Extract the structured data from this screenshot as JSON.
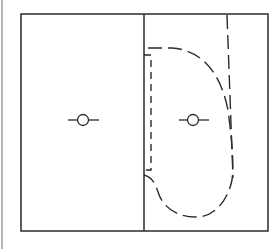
{
  "diagram": {
    "type": "floor-plan-layout",
    "colors": {
      "line": "#2a2a2a",
      "background": "#ffffff",
      "edge": "#b8b8b8"
    },
    "frame": {
      "x": 21,
      "y": 14,
      "width": 247,
      "height": 217
    },
    "divider_x": 144,
    "symbols": [
      {
        "name": "left-fixture-symbol",
        "cx": 83,
        "cy": 120,
        "r": 5.5,
        "line_from": 68,
        "line_to": 99
      },
      {
        "name": "right-fixture-symbol",
        "cx": 193,
        "cy": 120,
        "r": 5.5,
        "line_from": 179,
        "line_to": 209
      }
    ],
    "dashed_paths": [
      {
        "name": "swing-area-outline",
        "d": "M148,48 L172,48 C200,50 220,70 228,110 C232,140 234,165 232,180 C228,200 215,216 198,217 C178,218 163,208 158,192 C155,182 151,177 144,175"
      },
      {
        "name": "inner-vertical-guide",
        "d": "M144,55 L151,55 L151,170 L144,170"
      },
      {
        "name": "right-vertical-guide",
        "d": "M227,15 L233,178"
      }
    ]
  }
}
